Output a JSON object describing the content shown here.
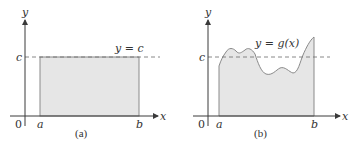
{
  "colors": {
    "axis": "#3a3a3a",
    "fill": "#e6e6e6",
    "outline": "#8a8a8a",
    "dashed": "#6a6a6a",
    "text": "#333333"
  },
  "panels": [
    {
      "id": "a",
      "caption": "(a)",
      "y_axis_label": "y",
      "x_axis_label": "x",
      "origin_label": "0",
      "level_label": "c",
      "a_label": "a",
      "b_label": "b",
      "curve_label": "y = c",
      "shape": "rectangle"
    },
    {
      "id": "b",
      "caption": "(b)",
      "y_axis_label": "y",
      "x_axis_label": "x",
      "origin_label": "0",
      "level_label": "c",
      "a_label": "a",
      "b_label": "b",
      "curve_label": "y = g(x)",
      "shape": "region under curve"
    }
  ]
}
